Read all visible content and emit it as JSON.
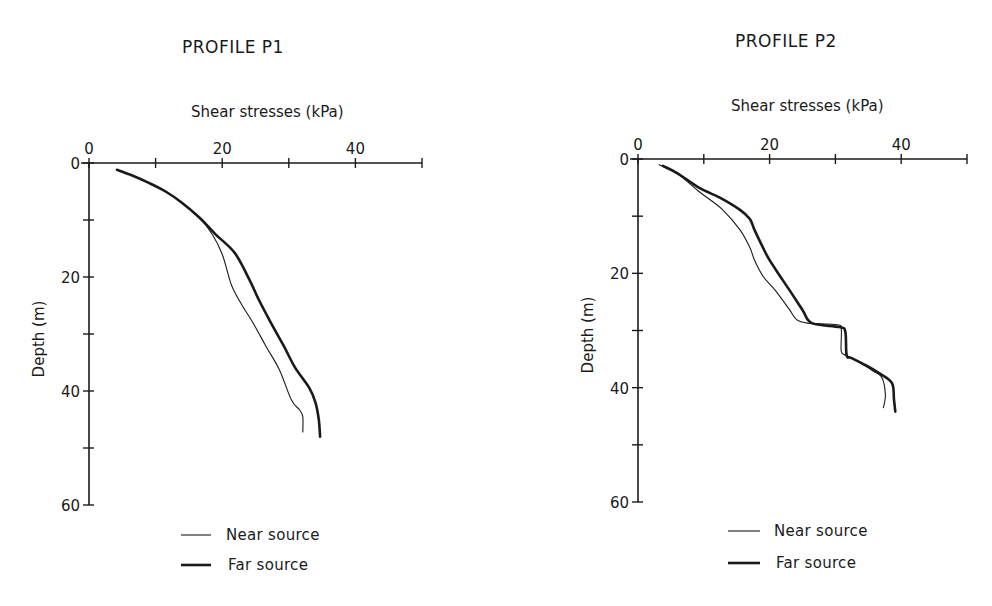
{
  "figure": {
    "panels": [
      {
        "id": "p1",
        "title": "PROFILE P1",
        "xlabel": "Shear stresses (kPa)",
        "ylabel": "Depth (m)",
        "legend": [
          {
            "label": "Near source",
            "series": "near"
          },
          {
            "label": "Far source",
            "series": "far"
          }
        ]
      },
      {
        "id": "p2",
        "title": "PROFILE P2",
        "xlabel": "Shear stresses (kPa)",
        "ylabel": "Depth (m)",
        "legend": [
          {
            "label": "Near source",
            "series": "near"
          },
          {
            "label": "Far source",
            "series": "far"
          }
        ]
      }
    ],
    "colors": {
      "line": "#1a1a1a",
      "background": "#ffffff"
    }
  },
  "chart_data": [
    {
      "type": "line",
      "title": "PROFILE P1",
      "xlabel": "Shear stresses (kPa)",
      "ylabel": "Depth (m)",
      "xlim": [
        0,
        50
      ],
      "ylim": [
        0,
        60
      ],
      "y_inverted": true,
      "x_axis_position": "top",
      "x_ticks": [
        0,
        10,
        20,
        30,
        40,
        50
      ],
      "x_tick_labels": [
        "0",
        "",
        "20",
        "",
        "40",
        ""
      ],
      "y_ticks": [
        0,
        10,
        20,
        30,
        40,
        50,
        60
      ],
      "y_tick_labels": [
        "0",
        "",
        "20",
        "",
        "40",
        "",
        "60"
      ],
      "grid": false,
      "legend_position": "bottom",
      "series": [
        {
          "name": "Near source",
          "line_width": "thin",
          "points": [
            [
              4.2,
              1.2
            ],
            [
              6.5,
              2.2
            ],
            [
              9.0,
              3.5
            ],
            [
              11.5,
              5.0
            ],
            [
              14.0,
              7.0
            ],
            [
              16.6,
              9.6
            ],
            [
              18.5,
              12.5
            ],
            [
              20.0,
              16.0
            ],
            [
              21.0,
              20.0
            ],
            [
              21.6,
              22.0
            ],
            [
              23.0,
              25.0
            ],
            [
              24.6,
              28.0
            ],
            [
              26.5,
              32.0
            ],
            [
              28.6,
              36.3
            ],
            [
              30.4,
              41.6
            ],
            [
              31.6,
              43.3
            ],
            [
              32.1,
              44.5
            ],
            [
              32.1,
              47.2
            ]
          ]
        },
        {
          "name": "Far source",
          "line_width": "thick",
          "points": [
            [
              4.2,
              1.2
            ],
            [
              6.5,
              2.2
            ],
            [
              9.0,
              3.5
            ],
            [
              11.5,
              5.0
            ],
            [
              14.0,
              7.0
            ],
            [
              16.6,
              9.6
            ],
            [
              19.0,
              12.5
            ],
            [
              21.9,
              15.8
            ],
            [
              24.1,
              20.5
            ],
            [
              25.5,
              24.0
            ],
            [
              27.3,
              28.0
            ],
            [
              29.2,
              32.0
            ],
            [
              30.9,
              35.8
            ],
            [
              33.1,
              39.5
            ],
            [
              34.0,
              42.0
            ],
            [
              34.5,
              45.0
            ],
            [
              34.7,
              48.0
            ]
          ]
        }
      ]
    },
    {
      "type": "line",
      "title": "PROFILE P2",
      "xlabel": "Shear stresses (kPa)",
      "ylabel": "Depth (m)",
      "xlim": [
        0,
        50
      ],
      "ylim": [
        0,
        60
      ],
      "y_inverted": true,
      "x_axis_position": "top",
      "x_ticks": [
        0,
        10,
        20,
        30,
        40,
        50
      ],
      "x_tick_labels": [
        "0",
        "",
        "20",
        "",
        "40",
        ""
      ],
      "y_ticks": [
        0,
        10,
        20,
        30,
        40,
        50,
        60
      ],
      "y_tick_labels": [
        "0",
        "",
        "20",
        "",
        "40",
        "",
        "60"
      ],
      "grid": false,
      "legend_position": "bottom",
      "series": [
        {
          "name": "Near source",
          "line_width": "thin",
          "points": [
            [
              3.2,
              1.0
            ],
            [
              6.0,
              2.6
            ],
            [
              9.4,
              5.8
            ],
            [
              12.8,
              8.8
            ],
            [
              15.5,
              12.4
            ],
            [
              17.0,
              15.5
            ],
            [
              17.7,
              17.7
            ],
            [
              19.0,
              20.5
            ],
            [
              20.8,
              22.9
            ],
            [
              23.0,
              26.3
            ],
            [
              24.1,
              28.1
            ],
            [
              25.8,
              28.7
            ],
            [
              30.3,
              29.0
            ],
            [
              30.9,
              29.9
            ],
            [
              30.9,
              33.7
            ],
            [
              31.8,
              34.4
            ],
            [
              34.0,
              35.8
            ],
            [
              35.9,
              37.2
            ],
            [
              37.1,
              38.3
            ],
            [
              37.6,
              41.3
            ],
            [
              37.3,
              43.5
            ]
          ]
        },
        {
          "name": "Far source",
          "line_width": "thick",
          "points": [
            [
              3.8,
              1.2
            ],
            [
              6.0,
              2.5
            ],
            [
              9.4,
              5.1
            ],
            [
              12.5,
              6.8
            ],
            [
              15.5,
              8.9
            ],
            [
              17.0,
              10.5
            ],
            [
              17.7,
              12.4
            ],
            [
              19.0,
              15.5
            ],
            [
              20.0,
              17.7
            ],
            [
              21.6,
              20.5
            ],
            [
              23.0,
              22.9
            ],
            [
              25.0,
              26.4
            ],
            [
              26.4,
              28.7
            ],
            [
              30.6,
              29.4
            ],
            [
              31.5,
              30.2
            ],
            [
              31.7,
              34.3
            ],
            [
              32.4,
              34.8
            ],
            [
              34.5,
              36.0
            ],
            [
              36.7,
              37.5
            ],
            [
              38.6,
              39.2
            ],
            [
              38.9,
              42.1
            ],
            [
              39.1,
              44.2
            ]
          ]
        }
      ]
    }
  ]
}
